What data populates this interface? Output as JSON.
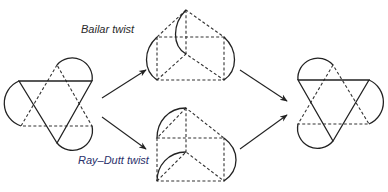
{
  "diagram": {
    "type": "reaction-mechanism",
    "nodes": [
      {
        "id": "octahedron-start",
        "shape": "octahedron"
      },
      {
        "id": "prism-bailar",
        "shape": "trigonal-prism"
      },
      {
        "id": "prism-ray-dutt",
        "shape": "trigonal-prism"
      },
      {
        "id": "octahedron-end",
        "shape": "octahedron"
      }
    ],
    "edges": [
      {
        "from": "octahedron-start",
        "to": "prism-bailar",
        "label": "Bailar twist"
      },
      {
        "from": "octahedron-start",
        "to": "prism-ray-dutt",
        "label": "Ray–Dutt twist"
      },
      {
        "from": "prism-bailar",
        "to": "octahedron-end",
        "label": ""
      },
      {
        "from": "prism-ray-dutt",
        "to": "octahedron-end",
        "label": ""
      }
    ]
  },
  "labels": {
    "bailar": "Bailar twist",
    "ray_dutt": "Ray–Dutt twist"
  },
  "colors": {
    "line": "#222222",
    "ray_dutt_label": "#2a2f6a"
  }
}
